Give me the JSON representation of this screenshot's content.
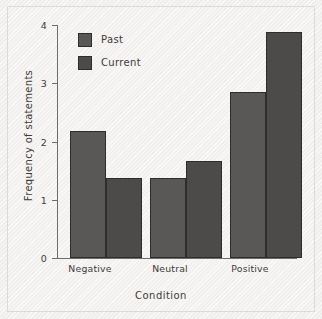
{
  "chart_data": {
    "type": "bar",
    "title": "",
    "subtitle": "",
    "xlabel": "Condition",
    "ylabel": "Frequency of statements",
    "categories": [
      "Negative",
      "Neutral",
      "Positive"
    ],
    "series": [
      {
        "name": "Past",
        "values": [
          2.18,
          1.37,
          2.85
        ],
        "color": "#5a5857"
      },
      {
        "name": "Current",
        "values": [
          1.37,
          1.67,
          3.88
        ],
        "color": "#4d4b4a"
      }
    ],
    "ylim": [
      0,
      4
    ],
    "yticks": [
      "0",
      "1",
      "2",
      "3",
      "4"
    ],
    "grid": false,
    "legend_position": "upper-left-inside",
    "annotations": []
  },
  "figure": {
    "background_color": "#f3f1ef",
    "border_color": "#dcdad7",
    "axis_color": "#6e6c6a",
    "text_color": "#3d3b39",
    "bar_edge_color": "#2e2d2c"
  }
}
